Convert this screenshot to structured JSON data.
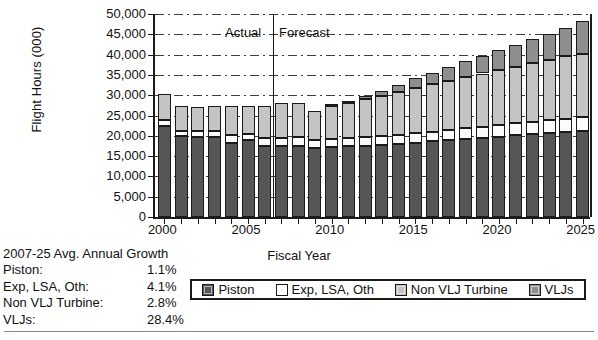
{
  "chart_data": {
    "type": "bar",
    "subtype": "stacked-vertical",
    "title": "",
    "xlabel": "Fiscal Year",
    "ylabel": "Flight Hours (000)",
    "ylim": [
      0,
      50000
    ],
    "ytick_step": 5000,
    "ytick_labels": [
      "0",
      "5,000",
      "10,000",
      "15,000",
      "20,000",
      "25,000",
      "30,000",
      "35,000",
      "40,000",
      "45,000",
      "50,000"
    ],
    "ytick_values": [
      0,
      5000,
      10000,
      15000,
      20000,
      25000,
      30000,
      35000,
      40000,
      45000,
      50000
    ],
    "grid": "horizontal-dash-dot",
    "legend_position": "bottom",
    "categories": [
      2000,
      2001,
      2002,
      2003,
      2004,
      2005,
      2006,
      2007,
      2008,
      2009,
      2010,
      2011,
      2012,
      2013,
      2014,
      2015,
      2016,
      2017,
      2018,
      2019,
      2020,
      2021,
      2022,
      2023,
      2024,
      2025
    ],
    "xtick_labels": [
      "2000",
      "2005",
      "2010",
      "2015",
      "2020",
      "2025"
    ],
    "xtick_label_years": [
      2000,
      2005,
      2010,
      2015,
      2020,
      2025
    ],
    "series": [
      {
        "name": "Piston",
        "color": "#565656",
        "values": [
          22300,
          19900,
          19800,
          19700,
          18200,
          18900,
          17400,
          17600,
          17400,
          17000,
          17200,
          17400,
          17600,
          17800,
          18000,
          18300,
          18600,
          18900,
          19200,
          19500,
          19800,
          20100,
          20400,
          20700,
          21000,
          21200
        ]
      },
      {
        "name": "Exp, LSA, Oth",
        "color": "#ffffff",
        "values": [
          1500,
          1300,
          1500,
          1500,
          1900,
          1500,
          2000,
          1800,
          2300,
          2000,
          2000,
          2050,
          2100,
          2200,
          2250,
          2350,
          2450,
          2550,
          2650,
          2750,
          2850,
          2950,
          3050,
          3150,
          3250,
          3350
        ]
      },
      {
        "name": "Non VLJ Turbine",
        "color": "#c4c4c4",
        "values": [
          6600,
          6200,
          5900,
          6200,
          7300,
          6900,
          8000,
          8600,
          8300,
          7000,
          8200,
          8700,
          9300,
          9800,
          10600,
          11200,
          11600,
          12000,
          12600,
          13100,
          13600,
          14000,
          14500,
          14900,
          15300,
          15700
        ]
      },
      {
        "name": "VLJs",
        "color": "#8e8e8e",
        "values": [
          0,
          0,
          0,
          0,
          0,
          0,
          0,
          0,
          0,
          0,
          200,
          450,
          800,
          1200,
          1700,
          2300,
          2900,
          3400,
          3900,
          4400,
          4900,
          5400,
          5900,
          6400,
          7000,
          8050
        ]
      }
    ],
    "totals": [
      30400,
      27400,
      27200,
      27400,
      27400,
      27300,
      27400,
      28000,
      28000,
      26000,
      27600,
      28600,
      29800,
      31000,
      32550,
      34150,
      35550,
      36850,
      38350,
      39750,
      41150,
      42450,
      43850,
      45150,
      46550,
      48300
    ],
    "annotations": [
      {
        "text": "Actual",
        "position": "left-of-divider"
      },
      {
        "text": "Forecast",
        "position": "right-of-divider"
      }
    ],
    "divider": {
      "between_years": [
        2006,
        2007
      ],
      "label_left": "Actual",
      "label_right": "Forecast"
    }
  },
  "growth_table": {
    "title": "2007-25 Avg. Annual Growth",
    "rows": [
      {
        "label": "Piston:",
        "value": "1.1%"
      },
      {
        "label": "Exp, LSA, Oth:",
        "value": "4.1%"
      },
      {
        "label": "Non VLJ Turbine:",
        "value": "2.8%"
      },
      {
        "label": "VLJs:",
        "value": "28.4%"
      }
    ]
  },
  "legend": {
    "items": [
      {
        "label": "Piston",
        "swatch": "piston"
      },
      {
        "label": "Exp, LSA, Oth",
        "swatch": "exp"
      },
      {
        "label": "Non VLJ Turbine",
        "swatch": "nonvlj"
      },
      {
        "label": "VLJs",
        "swatch": "vlj"
      }
    ]
  }
}
